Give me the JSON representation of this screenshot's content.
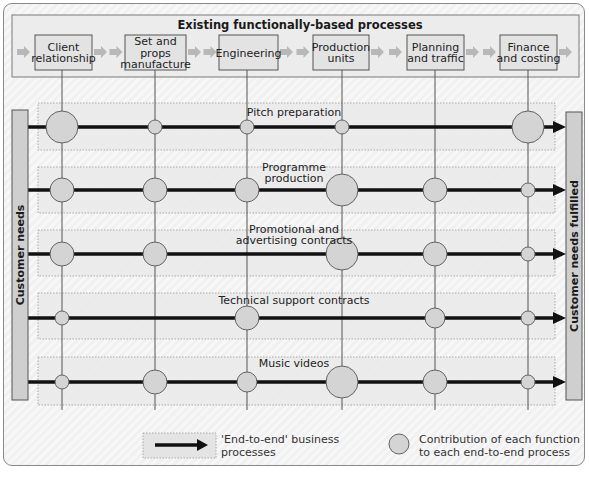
{
  "header": {
    "title": "Existing functionally-based processes",
    "functions": [
      {
        "lines": [
          "Client",
          "relationship"
        ]
      },
      {
        "lines": [
          "Set and",
          "props",
          "manufacture"
        ]
      },
      {
        "lines": [
          "Engineering"
        ]
      },
      {
        "lines": [
          "Production",
          "units"
        ]
      },
      {
        "lines": [
          "Planning",
          "and traffic"
        ]
      },
      {
        "lines": [
          "Finance",
          "and costing"
        ]
      }
    ]
  },
  "left_bar": {
    "label": "Customer needs"
  },
  "right_bar": {
    "label": "Customer needs fulfilled"
  },
  "processes": [
    {
      "label_lines": [
        "Pitch preparation"
      ],
      "contributions": [
        "large",
        "small",
        "small",
        "small",
        "none",
        "large"
      ]
    },
    {
      "label_lines": [
        "Programme",
        "production"
      ],
      "contributions": [
        "medium",
        "medium",
        "medium",
        "large",
        "medium",
        "small"
      ]
    },
    {
      "label_lines": [
        "Promotional and",
        "advertising contracts"
      ],
      "contributions": [
        "medium",
        "medium",
        "none",
        "large",
        "medium",
        "small"
      ]
    },
    {
      "label_lines": [
        "Technical support contracts"
      ],
      "contributions": [
        "small",
        "none",
        "medium",
        "none",
        "medium-small",
        "small"
      ]
    },
    {
      "label_lines": [
        "Music videos"
      ],
      "contributions": [
        "small",
        "medium",
        "medium-small",
        "large",
        "medium",
        "small"
      ]
    }
  ],
  "legend": {
    "arrow_label_lines": [
      "'End-to-end' business",
      "processes"
    ],
    "circle_label_lines": [
      "Contribution of each function",
      "to each end-to-end process"
    ]
  },
  "colors": {
    "circle_fill": "#d4d4d4",
    "bar_fill": "#cfcfcf",
    "box_fill": "#e3e3e3",
    "header_arrow": "#b8b8b8",
    "process_arrow": "#111111"
  }
}
